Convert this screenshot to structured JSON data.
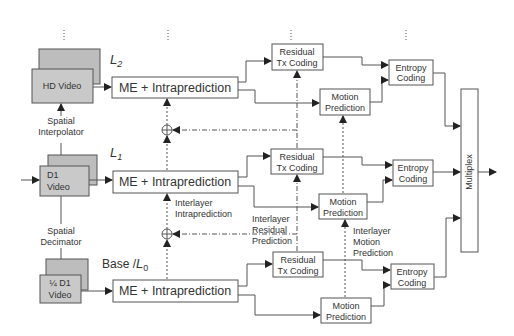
{
  "diagram": {
    "layers": [
      {
        "id": "L2",
        "label": "L",
        "sub": "2",
        "source": "HD Video",
        "me_block": "ME + Intraprediction",
        "residual": [
          "Residual",
          "Tx Coding"
        ],
        "motion": [
          "Motion",
          "Prediction"
        ],
        "entropy": [
          "Entropy",
          "Coding"
        ]
      },
      {
        "id": "L1",
        "label": "L",
        "sub": "1",
        "source": [
          "D1",
          "Video"
        ],
        "me_block": "ME + Intraprediction",
        "residual": [
          "Residual",
          "Tx Coding"
        ],
        "motion": [
          "Motion",
          "Prediction"
        ],
        "entropy": [
          "Entropy",
          "Coding"
        ]
      },
      {
        "id": "L0",
        "label_prefix": "Base /",
        "label": "L",
        "sub": "0",
        "source": [
          "¼ D1",
          "Video"
        ],
        "me_block": "ME + Intraprediction",
        "residual": [
          "Residual",
          "Tx Coding"
        ],
        "motion": [
          "Motion",
          "Prediction"
        ],
        "entropy": [
          "Entropy",
          "Coding"
        ]
      }
    ],
    "spatial_interpolator": [
      "Spatial",
      "Interpolator"
    ],
    "spatial_decimator": [
      "Spatial",
      "Decimator"
    ],
    "interlayer_intra": [
      "Interlayer",
      "Intraprediction"
    ],
    "interlayer_residual": [
      "Interlayer",
      "Residual",
      "Prediction"
    ],
    "interlayer_motion": [
      "Interlayer",
      "Motion",
      "Prediction"
    ],
    "multiplex": "Multiplex",
    "adder_symbol": "+",
    "ellipsis": "⋮"
  }
}
